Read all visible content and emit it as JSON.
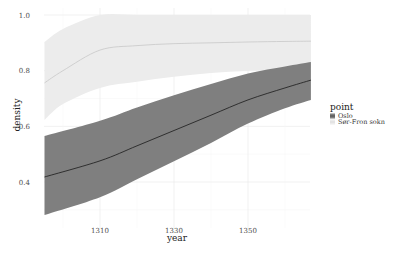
{
  "chart_data": {
    "type": "area",
    "title": "",
    "xlabel": "year",
    "ylabel": "density",
    "xlim": [
      1295,
      1367
    ],
    "ylim": [
      0.25,
      1.02
    ],
    "x_ticks": [
      1310,
      1330,
      1350
    ],
    "x_tick_labels": [
      "1310",
      "1330",
      "1350"
    ],
    "y_ticks": [
      0.4,
      0.6,
      0.8,
      1.0
    ],
    "y_tick_labels": [
      "0.4",
      "0.6",
      "0.8",
      "1.0"
    ],
    "grid": true,
    "legend": {
      "title": "point",
      "placement": "right"
    },
    "series": [
      {
        "name": "Sør-Fron sokn",
        "color": "#ececec",
        "line_color": "#c8c8c8",
        "x": [
          1295,
          1300,
          1310,
          1320,
          1330,
          1340,
          1350,
          1360,
          1367
        ],
        "mean": [
          0.756,
          0.8,
          0.874,
          0.89,
          0.897,
          0.9,
          0.903,
          0.905,
          0.906
        ],
        "lower": [
          0.623,
          0.68,
          0.738,
          0.76,
          0.778,
          0.792,
          0.8,
          0.806,
          0.81
        ],
        "upper": [
          0.903,
          0.95,
          1.0,
          1.0,
          1.0,
          1.0,
          1.0,
          1.0,
          1.0
        ]
      },
      {
        "name": "Oslo",
        "color": "#7f7f7f",
        "line_color": "#1a1a1a",
        "x": [
          1295,
          1310,
          1320,
          1330,
          1340,
          1350,
          1360,
          1367
        ],
        "mean": [
          0.418,
          0.476,
          0.53,
          0.585,
          0.64,
          0.695,
          0.738,
          0.766
        ],
        "lower": [
          0.281,
          0.345,
          0.41,
          0.475,
          0.54,
          0.61,
          0.665,
          0.695
        ],
        "upper": [
          0.565,
          0.62,
          0.668,
          0.712,
          0.752,
          0.79,
          0.815,
          0.831
        ]
      }
    ]
  }
}
